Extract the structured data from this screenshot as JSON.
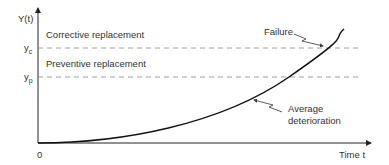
{
  "diagram": {
    "y_axis_label": "Y(t)",
    "x_axis_label": "Time t",
    "origin_label": "0",
    "thresholds": [
      {
        "symbol": "y",
        "subscript": "c",
        "region_label": "Corrective replacement"
      },
      {
        "symbol": "y",
        "subscript": "p",
        "region_label": "Preventive replacement"
      }
    ],
    "annotations": {
      "failure": "Failure",
      "average_line1": "Average",
      "average_line2": "deterioration"
    },
    "colors": {
      "axis": "#222222",
      "curve": "#111111",
      "dashed": "#888888",
      "text": "#333333"
    }
  }
}
